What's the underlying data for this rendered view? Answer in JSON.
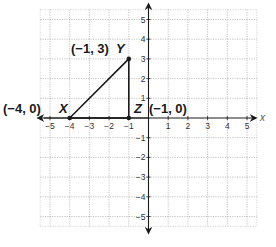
{
  "diagram": {
    "type": "coordinate-plane",
    "x_axis_label": "x",
    "x_range": [
      -5,
      5
    ],
    "y_range": [
      -5,
      5
    ],
    "x_ticks": [
      "−5",
      "−4",
      "−3",
      "−2",
      "−1",
      "1",
      "2",
      "3",
      "4",
      "5"
    ],
    "x_tick_values": [
      -5,
      -4,
      -3,
      -2,
      -1,
      1,
      2,
      3,
      4,
      5
    ],
    "y_ticks": [
      "5",
      "4",
      "3",
      "2",
      "1",
      "−1",
      "−2",
      "−3",
      "−4",
      "−5"
    ],
    "y_tick_values": [
      5,
      4,
      3,
      2,
      1,
      -1,
      -2,
      -3,
      -4,
      -5
    ],
    "grid": true,
    "points": [
      {
        "name": "X",
        "x": -4,
        "y": 0,
        "coord_label": "(−4, 0)"
      },
      {
        "name": "Y",
        "x": -1,
        "y": 3,
        "coord_label": "(−1, 3)"
      },
      {
        "name": "Z",
        "x": -1,
        "y": 0,
        "coord_label": "(−1, 0)"
      }
    ],
    "segments": [
      [
        "X",
        "Y"
      ],
      [
        "Y",
        "Z"
      ],
      [
        "Z",
        "X"
      ]
    ],
    "colors": {
      "ink": "#1a1a1a",
      "grid": "#9a9a9a"
    }
  },
  "labels": {
    "X_name": "X",
    "Y_name": "Y",
    "Z_name": "Z",
    "X_coord": "(−4, 0)",
    "Y_coord": "(−1, 3)",
    "Z_coord": "(−1, 0)",
    "x_axis": "x"
  }
}
